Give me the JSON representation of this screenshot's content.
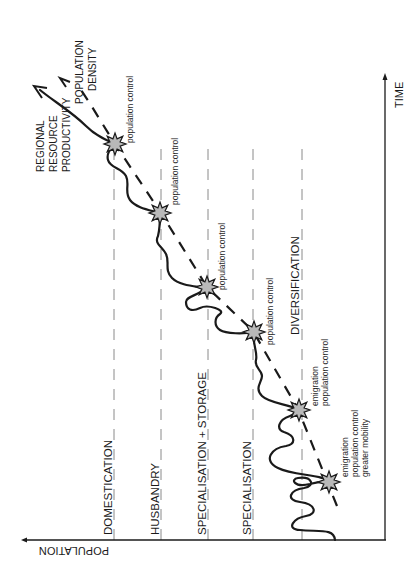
{
  "diagram": {
    "axes": {
      "x_label": "TIME",
      "y_label": "POPULATION"
    },
    "curves": {
      "resource": {
        "label_lines": [
          "REGIONAL",
          "RESOURCE",
          "PRODUCTIVITY"
        ]
      },
      "density": {
        "label_lines": [
          "POPULATION",
          "DENSITY"
        ]
      }
    },
    "stages": [
      {
        "label": "DIVERSIFICATION"
      },
      {
        "label": "SPECIALISATION"
      },
      {
        "label": "SPECIALISATION + STORAGE"
      },
      {
        "label": "HUSBANDRY"
      },
      {
        "label": "DOMESTICATION"
      }
    ],
    "crisis_events": [
      {
        "lines": [
          "emigration",
          "population control",
          "greater mobility"
        ]
      },
      {
        "lines": [
          "emigration",
          "population control"
        ]
      },
      {
        "lines": [
          "population control"
        ]
      },
      {
        "lines": [
          "population control"
        ]
      },
      {
        "lines": [
          "population control"
        ]
      },
      {
        "lines": [
          "population control"
        ]
      }
    ],
    "colors": {
      "line": "#1a1a1a",
      "dash_guide": "#8a8a8a",
      "star_fill": "#b9b9b9"
    }
  }
}
